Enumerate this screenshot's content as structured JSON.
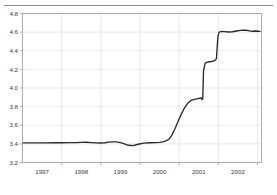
{
  "figure": {
    "background_color": "#ffffff",
    "top_rule_color": "#8a8a8a",
    "line_color": "#2b2b2b",
    "grid_color": "#d6d6d6",
    "frame_color": "#9a9a9a",
    "tick_label_color": "#3a3a3a"
  },
  "chart_data": {
    "type": "line",
    "title": "",
    "subtitle": "",
    "xlabel": "",
    "ylabel": "",
    "xlim": [
      1996.5,
      2002.6
    ],
    "ylim": [
      3.2,
      4.8
    ],
    "grid": true,
    "legend": null,
    "legend_position": "none",
    "y_ticks": [
      3.2,
      3.4,
      3.6,
      3.8,
      4.0,
      4.2,
      4.4,
      4.6,
      4.8
    ],
    "y_tick_labels": [
      "3.2",
      "3.4",
      "3.6",
      "3.8",
      "4.0",
      "4.2",
      "4.4",
      "4.6",
      "4.8"
    ],
    "x_ticks": [
      1997,
      1998,
      1999,
      2000,
      2001,
      2002
    ],
    "x_tick_labels": [
      "1997",
      "1998",
      "1999",
      "2000",
      "2001",
      "2002"
    ],
    "x_gridlines": [
      1996.5,
      1997.5,
      1998.5,
      1999.5,
      2000.5,
      2001.5,
      2002.5
    ],
    "series": [
      {
        "name": "series-1",
        "color": "#2b2b2b",
        "x": [
          1996.52,
          1996.7,
          1996.9,
          1997.1,
          1997.3,
          1997.5,
          1997.7,
          1997.85,
          1998.0,
          1998.12,
          1998.25,
          1998.38,
          1998.5,
          1998.6,
          1998.7,
          1998.8,
          1998.9,
          1999.0,
          1999.1,
          1999.2,
          1999.32,
          1999.45,
          1999.6,
          1999.75,
          1999.9,
          2000.0,
          2000.08,
          2000.16,
          2000.24,
          2000.32,
          2000.4,
          2000.48,
          2000.56,
          2000.64,
          2000.72,
          2000.8,
          2000.88,
          2000.96,
          2001.02,
          2001.06,
          2001.08,
          2001.1,
          2001.12,
          2001.16,
          2001.2,
          2001.26,
          2001.32,
          2001.38,
          2001.42,
          2001.45,
          2001.47,
          2001.49,
          2001.52,
          2001.58,
          2001.66,
          2001.76,
          2001.86,
          2001.96,
          2002.06,
          2002.16,
          2002.26,
          2002.36,
          2002.46,
          2002.56
        ],
        "y": [
          3.41,
          3.41,
          3.41,
          3.411,
          3.412,
          3.412,
          3.413,
          3.414,
          3.416,
          3.417,
          3.414,
          3.41,
          3.409,
          3.412,
          3.418,
          3.422,
          3.421,
          3.414,
          3.4,
          3.385,
          3.382,
          3.396,
          3.408,
          3.412,
          3.413,
          3.416,
          3.422,
          3.432,
          3.45,
          3.5,
          3.57,
          3.65,
          3.725,
          3.79,
          3.838,
          3.866,
          3.878,
          3.884,
          3.89,
          3.895,
          3.878,
          3.88,
          4.18,
          4.265,
          4.275,
          4.282,
          4.283,
          4.29,
          4.3,
          4.315,
          4.45,
          4.56,
          4.6,
          4.608,
          4.606,
          4.601,
          4.604,
          4.612,
          4.618,
          4.622,
          4.617,
          4.609,
          4.612,
          4.608
        ]
      }
    ],
    "annotations": []
  }
}
